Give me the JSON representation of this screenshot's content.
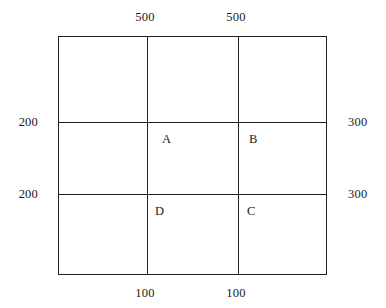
{
  "diagram": {
    "type": "grid-plan",
    "background_color": "#ffffff",
    "line_color": "#1f1f1f",
    "text_color": "#1a1a1a",
    "frame": {
      "left": 58,
      "top": 36,
      "right": 327,
      "bottom": 275,
      "width": 269,
      "height": 239
    },
    "internal_lines": {
      "vertical_x": [
        147,
        238
      ],
      "horizontal_y": [
        122,
        194
      ]
    },
    "top_labels": [
      {
        "text": "500",
        "x": 145
      },
      {
        "text": "500",
        "x": 236
      }
    ],
    "bottom_labels": [
      {
        "text": "100",
        "x": 145
      },
      {
        "text": "100",
        "x": 236
      }
    ],
    "left_labels": [
      {
        "text": "200",
        "y": 122
      },
      {
        "text": "200",
        "y": 194
      }
    ],
    "right_labels": [
      {
        "text": "300",
        "y": 122
      },
      {
        "text": "300",
        "y": 194
      }
    ],
    "cell_labels": [
      {
        "text": "A",
        "x": 162,
        "y": 133
      },
      {
        "text": "B",
        "x": 249,
        "y": 133
      },
      {
        "text": "D",
        "x": 155,
        "y": 205
      },
      {
        "text": "C",
        "x": 247,
        "y": 205
      }
    ]
  }
}
